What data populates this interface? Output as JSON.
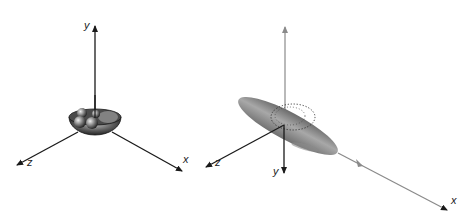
{
  "figure": {
    "panels": [
      {
        "id": "left",
        "description": "Bowl-shaped (oblate) object with spheres at origin of 3D axes",
        "axis_labels": {
          "y": "y",
          "z": "z",
          "x": "x"
        }
      },
      {
        "id": "right",
        "description": "Elongated prolate ellipsoid along x-axis with dotted ring, y-axis pointing down",
        "axis_labels": {
          "y": "y",
          "z": "z",
          "x": "x"
        }
      }
    ],
    "colors": {
      "axis_dark": "#1a1a1a",
      "axis_gray": "#8a8a8a",
      "shape_dark": "#3a3a3a",
      "shape_mid": "#8c8c8c",
      "shape_light": "#d0d0d0"
    }
  }
}
